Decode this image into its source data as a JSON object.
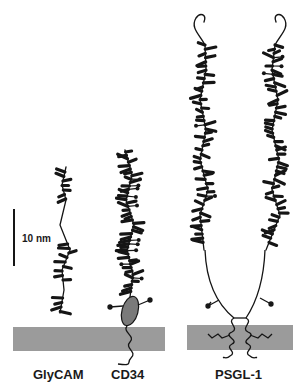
{
  "figure": {
    "type": "schematic",
    "colors": {
      "background": "#ffffff",
      "ink": "#151515",
      "membrane": "#9b9b9b",
      "globular_domain": "#7a7a7a"
    }
  },
  "scale_bar": {
    "label": "10 nm"
  },
  "molecules": [
    {
      "id": "glycam",
      "label": "GlyCAM"
    },
    {
      "id": "cd34",
      "label": "CD34"
    },
    {
      "id": "psgl1",
      "label": "PSGL-1"
    }
  ]
}
